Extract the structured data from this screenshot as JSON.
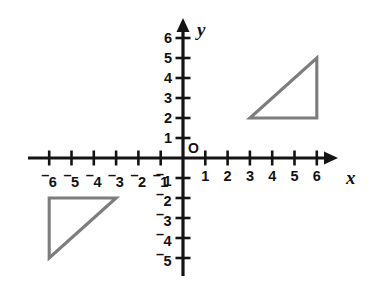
{
  "figure": {
    "origin_label": "O",
    "x_axis_name": "x",
    "y_axis_name": "y",
    "axis_color": "#141414",
    "shape_color": "#7d7d7d",
    "background_color": "#ffffff"
  },
  "chart_data": {
    "type": "scatter",
    "title": "",
    "xlabel": "x",
    "ylabel": "y",
    "xlim": [
      -7,
      7
    ],
    "ylim": [
      -6,
      7
    ],
    "grid": false,
    "legend": null,
    "x_ticks": [
      -6,
      -5,
      -4,
      -3,
      -2,
      -1,
      1,
      2,
      3,
      4,
      5,
      6
    ],
    "y_ticks": [
      -5,
      -4,
      -3,
      -2,
      -1,
      1,
      2,
      3,
      4,
      5,
      6
    ],
    "x_tick_labels": [
      "⁻6",
      "⁻5",
      "⁻4",
      "⁻3",
      "⁻2",
      "⁻1",
      "1",
      "2",
      "3",
      "4",
      "5",
      "6"
    ],
    "y_tick_labels": [
      "⁻5",
      "⁻4",
      "⁻3",
      "⁻2",
      "⁻1",
      "1",
      "2",
      "3",
      "4",
      "5",
      "6"
    ],
    "annotations": [
      {
        "text": "O",
        "x": 0,
        "y": 0,
        "role": "origin-label"
      },
      {
        "text": "x",
        "x": 7,
        "y": -0.6,
        "role": "x-axis-name"
      },
      {
        "text": "y",
        "x": 0.85,
        "y": 6.7,
        "role": "y-axis-name"
      }
    ],
    "shapes": [
      {
        "name": "upper-right-triangle",
        "type": "polygon",
        "closed": true,
        "vertices": [
          [
            3,
            2
          ],
          [
            6,
            2
          ],
          [
            6,
            5
          ]
        ],
        "stroke": "#7d7d7d",
        "fill": "none"
      },
      {
        "name": "lower-left-triangle",
        "type": "polygon",
        "closed": true,
        "vertices": [
          [
            -6,
            -2
          ],
          [
            -3,
            -2
          ],
          [
            -6,
            -5
          ]
        ],
        "stroke": "#7d7d7d",
        "fill": "none"
      }
    ]
  },
  "x_labels": [
    {
      "value": -6,
      "text": "6",
      "negative": true
    },
    {
      "value": -5,
      "text": "5",
      "negative": true
    },
    {
      "value": -4,
      "text": "4",
      "negative": true
    },
    {
      "value": -3,
      "text": "3",
      "negative": true
    },
    {
      "value": -2,
      "text": "2",
      "negative": true
    },
    {
      "value": -1,
      "text": "1",
      "negative": true
    },
    {
      "value": 1,
      "text": "1",
      "negative": false
    },
    {
      "value": 2,
      "text": "2",
      "negative": false
    },
    {
      "value": 3,
      "text": "3",
      "negative": false
    },
    {
      "value": 4,
      "text": "4",
      "negative": false
    },
    {
      "value": 5,
      "text": "5",
      "negative": false
    },
    {
      "value": 6,
      "text": "6",
      "negative": false
    }
  ],
  "y_labels": [
    {
      "value": 6,
      "text": "6",
      "negative": false
    },
    {
      "value": 5,
      "text": "5",
      "negative": false
    },
    {
      "value": 4,
      "text": "4",
      "negative": false
    },
    {
      "value": 3,
      "text": "3",
      "negative": false
    },
    {
      "value": 2,
      "text": "2",
      "negative": false
    },
    {
      "value": 1,
      "text": "1",
      "negative": false
    },
    {
      "value": -1,
      "text": "1",
      "negative": true
    },
    {
      "value": -2,
      "text": "2",
      "negative": true
    },
    {
      "value": -3,
      "text": "3",
      "negative": true
    },
    {
      "value": -4,
      "text": "4",
      "negative": true
    },
    {
      "value": -5,
      "text": "5",
      "negative": true
    }
  ]
}
